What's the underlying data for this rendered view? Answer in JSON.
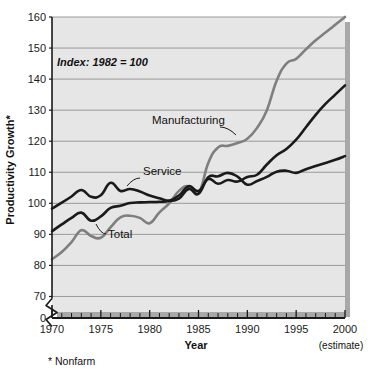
{
  "chart_data": {
    "type": "line",
    "title": "",
    "xlabel": "Year",
    "ylabel": "Productivity Growth*",
    "xlim": [
      1970,
      2000
    ],
    "ylim": [
      65,
      160
    ],
    "grid": true,
    "legend_position": "inline-annotations",
    "annotation": "Index: 1982 = 100",
    "footnote": "* Nonfarm",
    "estimate_note": "(estimate)",
    "axis_break": true,
    "axis_break_label": "0",
    "y_ticks": [
      70,
      80,
      90,
      100,
      110,
      120,
      130,
      140,
      150,
      160
    ],
    "y_tick_labels": [
      "70",
      "80",
      "90",
      "100",
      "110",
      "120",
      "130",
      "140",
      "150",
      "160"
    ],
    "x_ticks": [
      1970,
      1975,
      1980,
      1985,
      1990,
      1995,
      2000
    ],
    "x_tick_labels": [
      "1970",
      "1975",
      "1980",
      "1985",
      "1990",
      "1995",
      "2000"
    ],
    "x_minor_ticks": [
      1971,
      1972,
      1973,
      1974,
      1976,
      1977,
      1978,
      1979,
      1981,
      1982,
      1983,
      1984,
      1986,
      1987,
      1988,
      1989,
      1991,
      1992,
      1993,
      1994,
      1996,
      1997,
      1998,
      1999
    ],
    "x": [
      1970,
      1971,
      1972,
      1973,
      1974,
      1975,
      1976,
      1977,
      1978,
      1979,
      1980,
      1981,
      1982,
      1983,
      1984,
      1985,
      1986,
      1987,
      1988,
      1989,
      1990,
      1991,
      1992,
      1993,
      1994,
      1995,
      1996,
      1997,
      1998,
      1999,
      2000
    ],
    "series": [
      {
        "name": "Service",
        "color": "#1a1a1a",
        "width": 2.6,
        "label": "Service",
        "label_x": 143,
        "label_y": 175,
        "leader": [
          [
            140,
            178
          ],
          [
            127,
            186
          ]
        ],
        "values": [
          98.3,
          100.2,
          102.2,
          104.3,
          102.1,
          102.6,
          106.6,
          104.0,
          104.6,
          103.8,
          102.5,
          101.6,
          100.8,
          101.5,
          104.6,
          103.1,
          108.4,
          108.7,
          109.8,
          108.6,
          106.0,
          107.2,
          108.5,
          110.2,
          110.5,
          109.8,
          111.0,
          112.0,
          113.0,
          114.0,
          115.2
        ]
      },
      {
        "name": "Manufacturing",
        "color": "#7f7f7f",
        "width": 2.6,
        "label": "Manufacturing",
        "label_x": 152,
        "label_y": 124,
        "leader": [
          [
            220,
            127
          ],
          [
            236,
            135
          ]
        ],
        "values": [
          82.0,
          84.3,
          87.5,
          91.3,
          89.5,
          88.9,
          92.3,
          95.5,
          96.0,
          95.3,
          93.6,
          97.1,
          100.0,
          104.0,
          105.5,
          103.2,
          113.0,
          118.0,
          118.5,
          119.4,
          120.8,
          124.3,
          130.0,
          139.5,
          145.0,
          146.5,
          149.6,
          152.5,
          155.0,
          157.5,
          160.0
        ]
      },
      {
        "name": "Total",
        "color": "#1a1a1a",
        "width": 2.6,
        "label": "Total",
        "label_x": 108,
        "label_y": 238,
        "leader": [
          [
            106,
            234
          ],
          [
            96,
            224
          ]
        ],
        "values": [
          91.0,
          93.2,
          95.3,
          97.0,
          94.4,
          95.8,
          98.5,
          99.2,
          100.1,
          100.3,
          100.4,
          100.5,
          100.8,
          102.5,
          105.5,
          104.0,
          107.8,
          106.3,
          107.5,
          107.0,
          108.5,
          109.2,
          112.5,
          115.5,
          117.5,
          120.5,
          124.5,
          128.5,
          132.0,
          135.0,
          138.0
        ]
      }
    ]
  },
  "style": {
    "plot_background": "#e6e6e6",
    "gridline_color": "#9a9a9a",
    "axis_color": "#1a1a1a",
    "shadow_color": "#a8a8a8",
    "page_background": "#ffffff"
  }
}
